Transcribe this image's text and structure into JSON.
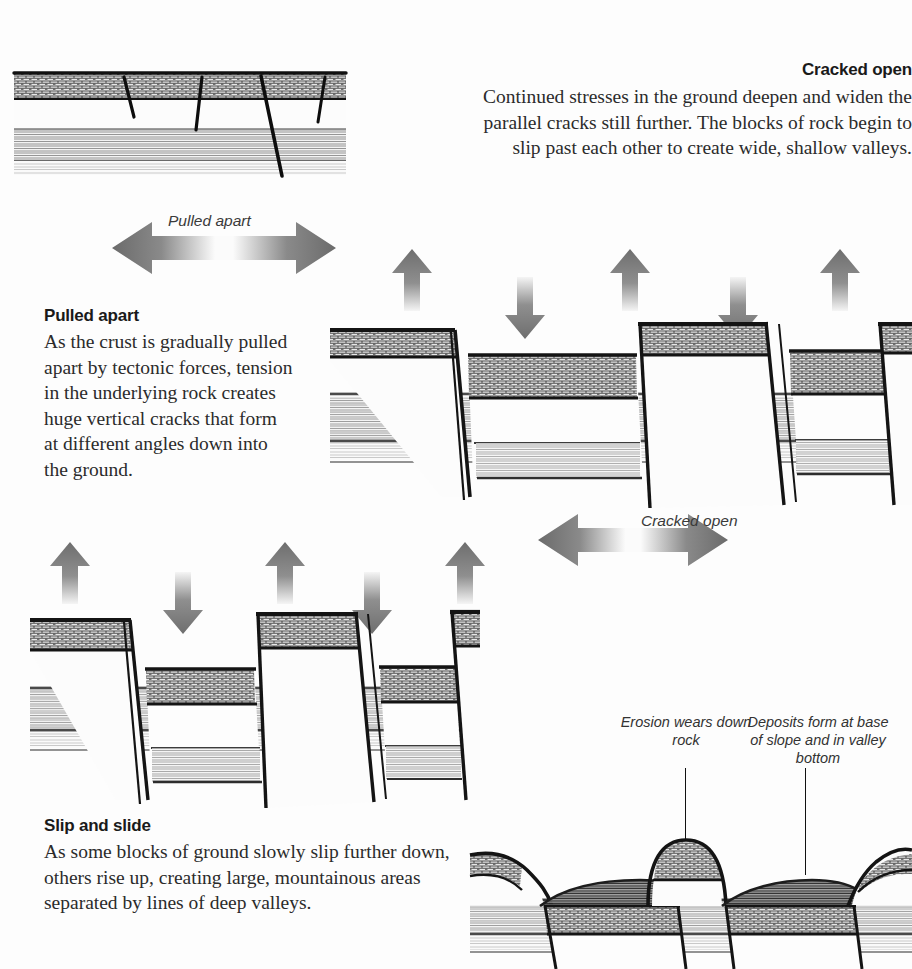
{
  "figure": {
    "domain": "geology-diagram"
  },
  "blocks": {
    "cracked_open": {
      "heading": "Cracked open",
      "body": "Continued stresses in the ground deepen and widen the parallel cracks still further. The blocks of rock begin to slip past each other to create wide, shallow valleys."
    },
    "pulled_apart": {
      "heading": "Pulled apart",
      "body": "As the crust is gradually pulled apart by tectonic forces, tension in the underlying rock creates huge vertical cracks that form at different angles down into the ground."
    },
    "slip_and_slide": {
      "heading": "Slip and slide",
      "body": "As some blocks of ground slowly slip further down, others rise up, creating large, mountainous areas separated by lines of deep valleys."
    }
  },
  "arrow_captions": {
    "pulled_apart": "Pulled apart",
    "cracked_open": "Cracked open"
  },
  "callouts": {
    "erosion": "Erosion wears down rock",
    "deposits": "Deposits form at base of slope and in valley bottom"
  },
  "colors": {
    "arrow_dark": "#6e6e6e",
    "arrow_light": "#f2f2f2",
    "ink": "#1a1a1a",
    "body_text": "#2b2b2b",
    "background": "#fdfdfd",
    "rock_dark": "#3a3a3a",
    "rock_mid": "#8d8d8d",
    "rock_light": "#c9c9c9"
  },
  "diagram_data": {
    "type": "diagram",
    "stages": [
      {
        "index": 1,
        "name": "Pulled apart",
        "panel": "top-left",
        "description": "Flat layered crust with four near-vertical cracks descending at different angles",
        "crack_count": 4,
        "layers": [
          "dark stippled surface layer",
          "pale banded rock",
          "striated lower rock"
        ]
      },
      {
        "index": 2,
        "name": "Cracked open",
        "panel": "middle-right",
        "description": "Blocks slipped to form two wide shallow valleys between three raised blocks",
        "up_arrows": 3,
        "down_arrows": 2,
        "blocks": 5
      },
      {
        "index": 3,
        "name": "Slip and slide",
        "panel": "middle-left",
        "description": "Deeper grabens; raised horst blocks form mountainous areas",
        "up_arrows": 3,
        "down_arrows": 2,
        "blocks": 5
      },
      {
        "index": 4,
        "name": "Erosion and deposition",
        "panel": "bottom-right",
        "description": "Rounded eroded summits with sediment deposits at slope bases and valley floors",
        "callout_count": 2
      }
    ],
    "motion_labels": [
      {
        "label": "Pulled apart",
        "direction": "horizontal double arrow",
        "stage": 1
      },
      {
        "label": "Cracked open",
        "direction": "horizontal double arrow",
        "stage": 2
      }
    ]
  }
}
